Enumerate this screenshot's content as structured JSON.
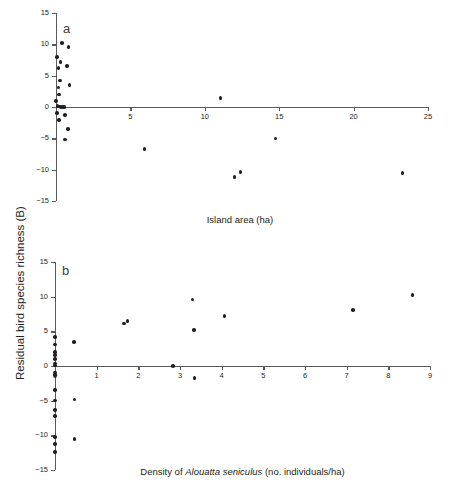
{
  "figure": {
    "y_axis_label": "Residual bird species richness (B)",
    "panels": [
      {
        "letter": "a",
        "x_axis_label": "Island area (ha)"
      },
      {
        "letter": "b",
        "x_axis_label_prefix": "Density of ",
        "x_axis_label_italic": "Alouatta seniculus",
        "x_axis_label_suffix": " (no. individuals/ha)"
      }
    ]
  },
  "chart_data": [
    {
      "type": "scatter",
      "panel": "a",
      "title": "",
      "xlabel": "Island area (ha)",
      "ylabel": "Residual bird species richness (B)",
      "xlim": [
        0,
        25
      ],
      "ylim": [
        -15,
        15
      ],
      "xticks": [
        0,
        5,
        10,
        15,
        20,
        25
      ],
      "yticks": [
        -15,
        -10,
        -5,
        0,
        5,
        10,
        15
      ],
      "xticklabels": [
        "0",
        "5",
        "10",
        "15",
        "20",
        "25"
      ],
      "yticklabels": [
        "−15",
        "−10",
        "−5",
        "0",
        "5",
        "10",
        "15"
      ],
      "grid": false,
      "legend": false,
      "marker": "filled-circle",
      "marker_color": "#231f20",
      "points": [
        {
          "x": 0.4,
          "y": 10.2
        },
        {
          "x": 0.85,
          "y": 9.6
        },
        {
          "x": 0.05,
          "y": 8.0
        },
        {
          "x": 0.3,
          "y": 7.2
        },
        {
          "x": 0.18,
          "y": 6.2
        },
        {
          "x": 0.72,
          "y": 6.5
        },
        {
          "x": 0.28,
          "y": 4.2
        },
        {
          "x": 0.17,
          "y": 3.1
        },
        {
          "x": 0.9,
          "y": 3.5
        },
        {
          "x": 0.2,
          "y": 2.0
        },
        {
          "x": 0.02,
          "y": 1.0
        },
        {
          "x": 11.05,
          "y": 1.4
        },
        {
          "x": 0.1,
          "y": 0.15
        },
        {
          "x": 0.22,
          "y": 0.05
        },
        {
          "x": 0.34,
          "y": 0.02
        },
        {
          "x": 0.46,
          "y": -0.04
        },
        {
          "x": 0.58,
          "y": 0.0
        },
        {
          "x": 0.08,
          "y": -0.95
        },
        {
          "x": 0.6,
          "y": -1.25
        },
        {
          "x": 0.22,
          "y": -2.05
        },
        {
          "x": 0.82,
          "y": -3.55
        },
        {
          "x": 0.62,
          "y": -5.2
        },
        {
          "x": 5.95,
          "y": -6.7
        },
        {
          "x": 14.75,
          "y": -5.0
        },
        {
          "x": 12.0,
          "y": -11.2
        },
        {
          "x": 12.4,
          "y": -10.35
        },
        {
          "x": 23.3,
          "y": -10.55
        }
      ]
    },
    {
      "type": "scatter",
      "panel": "b",
      "title": "",
      "xlabel": "Density of Alouatta seniculus (no. individuals/ha)",
      "ylabel": "Residual bird species richness (B)",
      "xlim": [
        0,
        9
      ],
      "ylim": [
        -15,
        15
      ],
      "xticks": [
        0,
        1,
        2,
        3,
        4,
        5,
        6,
        7,
        8,
        9
      ],
      "yticks": [
        -15,
        -10,
        -5,
        0,
        5,
        10,
        15
      ],
      "xticklabels": [
        "0",
        "1",
        "2",
        "3",
        "4",
        "5",
        "6",
        "7",
        "8",
        "9"
      ],
      "yticklabels": [
        "−15",
        "−10",
        "−5",
        "0",
        "5",
        "10",
        "15"
      ],
      "grid": false,
      "legend": false,
      "marker": "filled-circle",
      "marker_color": "#231f20",
      "points": [
        {
          "x": 8.58,
          "y": 10.2
        },
        {
          "x": 3.3,
          "y": 9.6
        },
        {
          "x": 7.15,
          "y": 8.05
        },
        {
          "x": 4.07,
          "y": 7.2
        },
        {
          "x": 1.66,
          "y": 6.15
        },
        {
          "x": 1.74,
          "y": 6.45
        },
        {
          "x": 3.33,
          "y": 5.15
        },
        {
          "x": 0.0,
          "y": 4.2
        },
        {
          "x": 0.45,
          "y": 3.45
        },
        {
          "x": 0.0,
          "y": 3.1
        },
        {
          "x": 0.0,
          "y": 2.05
        },
        {
          "x": 0.0,
          "y": 1.55
        },
        {
          "x": 0.0,
          "y": 1.0
        },
        {
          "x": 0.0,
          "y": 0.35
        },
        {
          "x": 0.0,
          "y": 0.1
        },
        {
          "x": 2.83,
          "y": 0.0
        },
        {
          "x": 0.0,
          "y": -0.95
        },
        {
          "x": 0.0,
          "y": -1.3
        },
        {
          "x": 3.35,
          "y": -1.75
        },
        {
          "x": 0.0,
          "y": -3.45
        },
        {
          "x": 0.0,
          "y": -5.0
        },
        {
          "x": 0.47,
          "y": -4.85
        },
        {
          "x": 0.0,
          "y": -6.35
        },
        {
          "x": 0.0,
          "y": -7.2
        },
        {
          "x": 0.0,
          "y": -10.2
        },
        {
          "x": 0.47,
          "y": -10.5
        },
        {
          "x": 0.0,
          "y": -11.25
        },
        {
          "x": 0.0,
          "y": -12.4
        }
      ]
    }
  ]
}
